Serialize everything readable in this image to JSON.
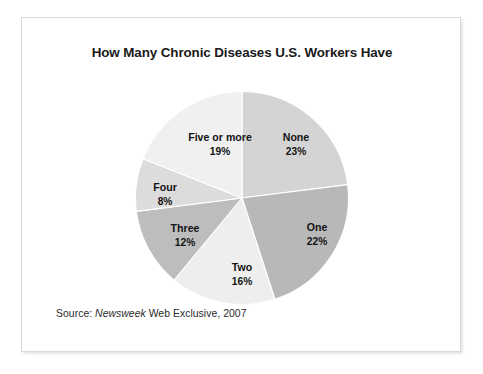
{
  "figure": {
    "title": "How Many Chronic Diseases U.S. Workers Have",
    "source_prefix": "Source:",
    "source_publication": "Newsweek",
    "source_suffix": "Web Exclusive, 2007"
  },
  "chart_data": {
    "type": "pie",
    "title": "How Many Chronic Diseases U.S. Workers Have",
    "xlabel": "",
    "ylabel": "",
    "unit": "%",
    "start_angle_deg": 0,
    "direction": "clockwise",
    "legend": "none-labels-inside-slices",
    "grid": false,
    "categories": [
      "None",
      "One",
      "Two",
      "Three",
      "Four",
      "Five or more"
    ],
    "values": [
      23,
      22,
      16,
      12,
      8,
      19
    ],
    "labels": [
      "23%",
      "22%",
      "16%",
      "12%",
      "8%",
      "19%"
    ],
    "colors": [
      "#d4d4d4",
      "#b8b8b8",
      "#eeeeee",
      "#bdbdbd",
      "#dcdcdc",
      "#f0f0f0"
    ],
    "slices": [
      {
        "category": "None",
        "value": 23,
        "label": "23%",
        "color": "#d4d4d4"
      },
      {
        "category": "One",
        "value": 22,
        "label": "22%",
        "color": "#b8b8b8"
      },
      {
        "category": "Two",
        "value": 16,
        "label": "16%",
        "color": "#eeeeee"
      },
      {
        "category": "Three",
        "value": 12,
        "label": "12%",
        "color": "#bdbdbd"
      },
      {
        "category": "Four",
        "value": 8,
        "label": "8%",
        "color": "#dcdcdc"
      },
      {
        "category": "Five or more",
        "value": 19,
        "label": "19%",
        "color": "#f0f0f0"
      }
    ]
  }
}
